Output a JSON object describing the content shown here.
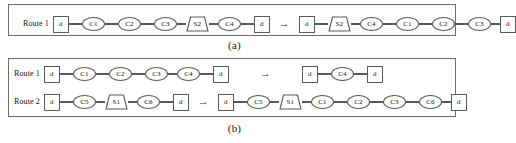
{
  "figure": {
    "panels": [
      {
        "id": "a",
        "caption": "(a)",
        "rows": [
          {
            "label": "Route 1",
            "before": [
              {
                "type": "depot",
                "text": "d"
              },
              {
                "type": "customer",
                "text": "C1"
              },
              {
                "type": "customer",
                "text": "C2"
              },
              {
                "type": "customer",
                "text": "C3"
              },
              {
                "type": "station",
                "text": "S2"
              },
              {
                "type": "customer",
                "text": "C4"
              },
              {
                "type": "depot",
                "text": "d"
              }
            ],
            "operator": "→",
            "after": [
              {
                "type": "depot",
                "text": "d"
              },
              {
                "type": "station",
                "text": "S2"
              },
              {
                "type": "customer",
                "text": "C4"
              },
              {
                "type": "customer",
                "text": "C1"
              },
              {
                "type": "customer",
                "text": "C2"
              },
              {
                "type": "customer",
                "text": "C3"
              },
              {
                "type": "depot",
                "text": "d"
              }
            ]
          }
        ]
      },
      {
        "id": "b",
        "caption": "(b)",
        "rows": [
          {
            "label": "Route 1",
            "before": [
              {
                "type": "depot",
                "text": "d"
              },
              {
                "type": "customer",
                "text": "C1"
              },
              {
                "type": "customer",
                "text": "C2"
              },
              {
                "type": "customer",
                "text": "C3"
              },
              {
                "type": "customer",
                "text": "C4"
              },
              {
                "type": "depot",
                "text": "d"
              }
            ],
            "operator": "→",
            "after": [
              {
                "type": "depot",
                "text": "d"
              },
              {
                "type": "customer",
                "text": "C4"
              },
              {
                "type": "depot",
                "text": "d"
              }
            ]
          },
          {
            "label": "Route 2",
            "before": [
              {
                "type": "depot",
                "text": "d"
              },
              {
                "type": "customer",
                "text": "C5"
              },
              {
                "type": "station",
                "text": "S1"
              },
              {
                "type": "customer",
                "text": "C6"
              },
              {
                "type": "depot",
                "text": "d"
              }
            ],
            "operator": "→",
            "after": [
              {
                "type": "depot",
                "text": "d"
              },
              {
                "type": "customer",
                "text": "C5"
              },
              {
                "type": "station",
                "text": "S1"
              },
              {
                "type": "customer",
                "text": "C1"
              },
              {
                "type": "customer",
                "text": "C2"
              },
              {
                "type": "customer",
                "text": "C3"
              },
              {
                "type": "customer",
                "text": "C6"
              },
              {
                "type": "depot",
                "text": "d"
              }
            ]
          }
        ]
      }
    ]
  }
}
